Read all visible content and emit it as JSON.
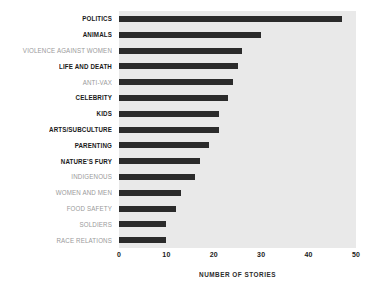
{
  "chart_data": {
    "type": "bar",
    "orientation": "horizontal",
    "title": "",
    "subtitle": "",
    "xlabel": "NUMBER OF STORIES",
    "ylabel": "",
    "xlim": [
      0,
      50
    ],
    "xticks": [
      0,
      10,
      20,
      30,
      40,
      50
    ],
    "xtick_labels": [
      "0",
      "10",
      "20",
      "30",
      "40",
      "50"
    ],
    "grid": false,
    "legend": null,
    "categories": [
      "POLITICS",
      "ANIMALS",
      "VIOLENCE AGAINST WOMEN",
      "LIFE AND DEATH",
      "ANTI-VAX",
      "CELEBRITY",
      "KIDS",
      "ARTS/SUBCULTURE",
      "PARENTING",
      "NATURE'S FURY",
      "INDIGENOUS",
      "WOMEN AND MEN",
      "FOOD SAFETY",
      "SOLDIERS",
      "RACE RELATIONS"
    ],
    "values": [
      47,
      30,
      26,
      25,
      24,
      23,
      21,
      21,
      19,
      17,
      16,
      13,
      12,
      10,
      10
    ],
    "label_styles": [
      "em",
      "em",
      "muted",
      "em",
      "muted",
      "em",
      "em",
      "em",
      "em",
      "em",
      "muted",
      "muted",
      "muted",
      "muted",
      "muted"
    ],
    "colors": {
      "bar": "#2b2b2b",
      "plot_background": "#e9e9e9",
      "page_background": "#ffffff",
      "label_emphasis": "#1a1a1a",
      "label_muted": "#9a9a9a",
      "axis_text": "#1a1a1a"
    }
  }
}
